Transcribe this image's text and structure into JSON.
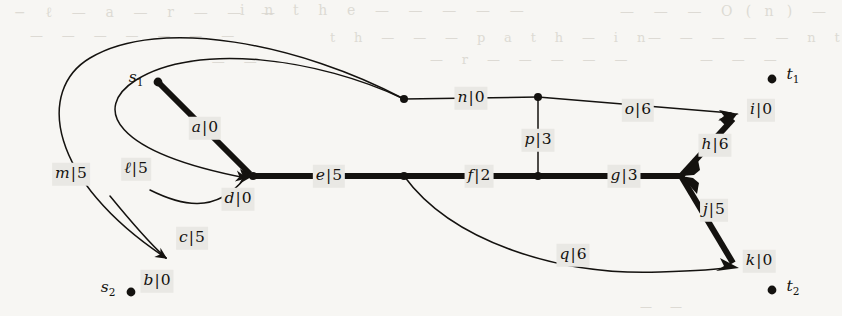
{
  "figure": {
    "kind": "flow-network-diagram",
    "background_color": "#f7f6f3",
    "ink_color": "#14120f",
    "label_background_color": "#e9e8e4",
    "thick_edge_width": 6,
    "thin_edge_width": 1.4
  },
  "nodes": [
    {
      "id": "s1",
      "label": "s",
      "sub": "1",
      "x": 158,
      "y": 82,
      "dot": true,
      "label_x": 136,
      "label_y": 79
    },
    {
      "id": "s2",
      "label": "s",
      "sub": "2",
      "x": 131,
      "y": 292,
      "dot": true,
      "label_x": 108,
      "label_y": 289
    },
    {
      "id": "t1",
      "label": "t",
      "sub": "1",
      "x": 772,
      "y": 79,
      "dot": true,
      "label_x": 793,
      "label_y": 76
    },
    {
      "id": "t2",
      "label": "t",
      "sub": "2",
      "x": 772,
      "y": 290,
      "dot": true,
      "label_x": 793,
      "label_y": 288
    },
    {
      "id": "b",
      "label": "",
      "sub": "",
      "x": 170,
      "y": 262,
      "dot": false,
      "label_x": 0,
      "label_y": 0
    },
    {
      "id": "d",
      "label": "",
      "sub": "",
      "x": 253,
      "y": 176,
      "dot": true,
      "label_x": 0,
      "label_y": 0
    },
    {
      "id": "w",
      "label": "",
      "sub": "",
      "x": 404,
      "y": 99,
      "dot": true,
      "label_x": 0,
      "label_y": 0
    },
    {
      "id": "v",
      "label": "",
      "sub": "",
      "x": 404,
      "y": 176,
      "dot": true,
      "label_x": 0,
      "label_y": 0
    },
    {
      "id": "pn",
      "label": "",
      "sub": "",
      "x": 538,
      "y": 97,
      "dot": true,
      "label_x": 0,
      "label_y": 0
    },
    {
      "id": "pf",
      "label": "",
      "sub": "",
      "x": 538,
      "y": 176,
      "dot": true,
      "label_x": 0,
      "label_y": 0
    },
    {
      "id": "fk",
      "label": "",
      "sub": "",
      "x": 681,
      "y": 176,
      "dot": false,
      "label_x": 0,
      "label_y": 0
    },
    {
      "id": "i",
      "label": "",
      "sub": "",
      "x": 737,
      "y": 115,
      "dot": false,
      "label_x": 0,
      "label_y": 0
    },
    {
      "id": "k",
      "label": "",
      "sub": "",
      "x": 737,
      "y": 268,
      "dot": false,
      "label_x": 0,
      "label_y": 0
    }
  ],
  "edges": [
    {
      "name": "a",
      "capacity": "0",
      "label_x": 205,
      "label_y": 128,
      "thick": true,
      "arrow": true
    },
    {
      "name": "b",
      "capacity": "0",
      "label_x": 157,
      "label_y": 281,
      "thick": false,
      "arrow": true
    },
    {
      "name": "c",
      "capacity": "5",
      "label_x": 192,
      "label_y": 238,
      "thick": false,
      "arrow": true
    },
    {
      "name": "d",
      "capacity": "0",
      "label_x": 238,
      "label_y": 199,
      "thick": true,
      "arrow": true
    },
    {
      "name": "e",
      "capacity": "5",
      "label_x": 329,
      "label_y": 176,
      "thick": true,
      "arrow": false
    },
    {
      "name": "f",
      "capacity": "2",
      "label_x": 479,
      "label_y": 176,
      "thick": true,
      "arrow": false
    },
    {
      "name": "g",
      "capacity": "3",
      "label_x": 624,
      "label_y": 176,
      "thick": true,
      "arrow": false
    },
    {
      "name": "h",
      "capacity": "6",
      "label_x": 715,
      "label_y": 145,
      "thick": true,
      "arrow": true
    },
    {
      "name": "i",
      "capacity": "0",
      "label_x": 761,
      "label_y": 110,
      "thick": false,
      "arrow": true
    },
    {
      "name": "j",
      "capacity": "5",
      "label_x": 714,
      "label_y": 210,
      "thick": true,
      "arrow": true
    },
    {
      "name": "k",
      "capacity": "0",
      "label_x": 759,
      "label_y": 261,
      "thick": false,
      "arrow": true
    },
    {
      "name": "ℓ",
      "capacity": "5",
      "label_x": 136,
      "label_y": 169,
      "thick": false,
      "arrow": true
    },
    {
      "name": "m",
      "capacity": "5",
      "label_x": 71,
      "label_y": 174,
      "thick": false,
      "arrow": true
    },
    {
      "name": "n",
      "capacity": "0",
      "label_x": 471,
      "label_y": 98,
      "thick": false,
      "arrow": false
    },
    {
      "name": "o",
      "capacity": "6",
      "label_x": 638,
      "label_y": 110,
      "thick": false,
      "arrow": false
    },
    {
      "name": "p",
      "capacity": "3",
      "label_x": 538,
      "label_y": 140,
      "thick": false,
      "arrow": false
    },
    {
      "name": "q",
      "capacity": "6",
      "label_x": 573,
      "label_y": 255,
      "thick": false,
      "arrow": false
    }
  ],
  "bleed_text": [
    {
      "text": "−   ℓ   —    a   —   r   —   —   —",
      "x": 14,
      "y": 4,
      "size": 14
    },
    {
      "text": "i   n   t   h   e   —   —   —   —   —",
      "x": 240,
      "y": 2,
      "size": 14
    },
    {
      "text": "—   —   —   O  (  n  )   —",
      "x": 620,
      "y": 3,
      "size": 14
    },
    {
      "text": "—   —   —   —   —   —   —",
      "x": 30,
      "y": 28,
      "size": 13
    },
    {
      "text": "t   h   —   —   —   p   a   t   h   —   i   n",
      "x": 330,
      "y": 30,
      "size": 13
    },
    {
      "text": "—   —   —   —   —   n   t",
      "x": 648,
      "y": 30,
      "size": 13
    },
    {
      "text": "—   —   —   —",
      "x": 180,
      "y": 54,
      "size": 13
    },
    {
      "text": "—   r   —   —   —   —   —",
      "x": 430,
      "y": 52,
      "size": 13
    },
    {
      "text": "—   —   —",
      "x": 700,
      "y": 52,
      "size": 13
    },
    {
      "text": "—   —",
      "x": 640,
      "y": 300,
      "size": 12
    }
  ]
}
